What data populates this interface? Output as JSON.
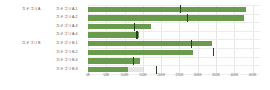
{
  "chart_data": {
    "type": "bar",
    "title": "",
    "subtitle": "",
    "xlabel": "",
    "ylabel": "",
    "xlim": [
      0,
      470000
    ],
    "grid": true,
    "legend_position": "none",
    "orientation": "horizontal",
    "colors": {
      "bar": "#6a9a4b",
      "marker": "#24421c",
      "background_bar": "#cfcfcf",
      "gridline": "#e6e6e6",
      "text": "#4d4d4d"
    },
    "groups": [
      {
        "label": "カテゴリA",
        "rows": [
          {
            "label": "カテゴリA-1",
            "value": 432000,
            "target": 252000
          },
          {
            "label": "カテゴリA-2",
            "value": 425000,
            "target": 272000
          },
          {
            "label": "カテゴリA-3",
            "value": 172000,
            "target": 128000
          },
          {
            "label": "カテゴリA-4",
            "value": 138000,
            "target": 134000
          }
        ]
      },
      {
        "label": "カテゴリB",
        "rows": [
          {
            "label": "カテゴリB-1",
            "value": 338000,
            "target": 282000
          },
          {
            "label": "カテゴリB-2",
            "value": 288000,
            "target": 342000
          },
          {
            "label": "カテゴリB-4",
            "value": 142000,
            "target": 124000
          },
          {
            "label": "カテゴリB-3",
            "value": 108000,
            "target": 188000,
            "background": 152000
          }
        ]
      }
    ],
    "categories": [
      "カテゴリA-1",
      "カテゴリA-2",
      "カテゴリA-3",
      "カテゴリA-4",
      "カテゴリB-1",
      "カテゴリB-2",
      "カテゴリB-4",
      "カテゴリB-3"
    ],
    "values": [
      432000,
      425000,
      172000,
      138000,
      338000,
      288000,
      142000,
      108000
    ],
    "targets": [
      252000,
      272000,
      128000,
      134000,
      282000,
      342000,
      124000,
      188000
    ],
    "axis": {
      "ticks": [
        0,
        50000,
        100000,
        150000,
        200000,
        250000,
        300000,
        350000,
        400000,
        450000
      ],
      "tick_labels": [
        "0K",
        "50K",
        "100K",
        "150K",
        "200K",
        "250K",
        "300K",
        "350K",
        "400K",
        "450K"
      ]
    }
  }
}
